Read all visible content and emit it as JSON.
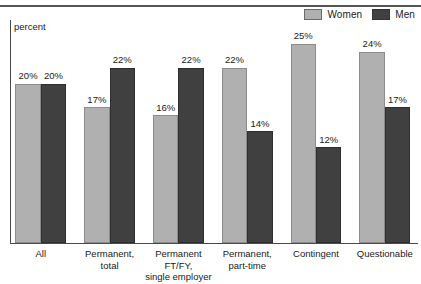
{
  "axis_caption": "percent",
  "legend": {
    "position": "top-right",
    "items": [
      {
        "label": "Women",
        "color": "#b0b0b0",
        "icon": "legend-swatch"
      },
      {
        "label": "Men",
        "color": "#404040",
        "icon": "legend-swatch"
      }
    ]
  },
  "chart_data": {
    "type": "bar",
    "title": "",
    "subtitle": "",
    "xlabel": "",
    "ylabel": "percent",
    "ylim": [
      0,
      28
    ],
    "grid": false,
    "legend_position": "top-right",
    "categories": [
      "All",
      "Permanent, total",
      "Permanent FT/FY, single employer",
      "Permanent, part-time",
      "Contingent",
      "Questionable"
    ],
    "category_lines": [
      [
        "All"
      ],
      [
        "Permanent,",
        "total"
      ],
      [
        "Permanent",
        "FT/FY,",
        "single employer"
      ],
      [
        "Permanent,",
        "part-time"
      ],
      [
        "Contingent"
      ],
      [
        "Questionable"
      ]
    ],
    "series": [
      {
        "name": "Women",
        "color": "#b0b0b0",
        "values": [
          20,
          17,
          16,
          22,
          25,
          24
        ],
        "labels": [
          "20%",
          "17%",
          "16%",
          "22%",
          "25%",
          "24%"
        ]
      },
      {
        "name": "Men",
        "color": "#404040",
        "values": [
          20,
          22,
          22,
          14,
          12,
          17
        ],
        "labels": [
          "20%",
          "22%",
          "22%",
          "14%",
          "12%",
          "17%"
        ]
      }
    ]
  }
}
